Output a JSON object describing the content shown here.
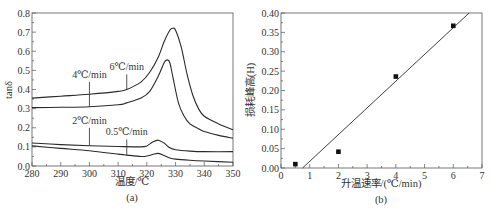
{
  "figure": {
    "caption_a": "(a)",
    "caption_b": "(b)"
  },
  "chart_data": [
    {
      "id": "a",
      "type": "line",
      "title": "",
      "xlabel": "温度/℃",
      "ylabel": "tanδ",
      "xlim": [
        280,
        350
      ],
      "ylim": [
        0.0,
        0.8
      ],
      "xticks": [
        280,
        290,
        300,
        310,
        320,
        330,
        340,
        350
      ],
      "xtick_labels": [
        "280",
        "290",
        "300",
        "310",
        "320",
        "330",
        "340",
        "350"
      ],
      "yticks": [
        0.0,
        0.1,
        0.2,
        0.3,
        0.4,
        0.5,
        0.6,
        0.7,
        0.8
      ],
      "ytick_labels": [
        "0.0",
        "0.1",
        "0.2",
        "0.3",
        "0.4",
        "0.5",
        "0.6",
        "0.7",
        "0.8"
      ],
      "grid": false,
      "legend": "inline annotations",
      "series": [
        {
          "name": "6℃/min",
          "x": [
            280,
            290,
            300,
            310,
            313,
            318,
            321,
            324,
            326,
            328,
            329,
            330,
            332,
            334,
            336,
            338,
            340,
            345,
            350
          ],
          "y": [
            0.355,
            0.365,
            0.375,
            0.39,
            0.4,
            0.44,
            0.49,
            0.57,
            0.65,
            0.71,
            0.72,
            0.71,
            0.62,
            0.48,
            0.37,
            0.3,
            0.26,
            0.22,
            0.19
          ],
          "label_x": 313,
          "label_y": 0.5,
          "anchor_x": 313,
          "anchor_y": 0.4
        },
        {
          "name": "4℃/min",
          "x": [
            280,
            290,
            300,
            310,
            313,
            318,
            321,
            324,
            326,
            327,
            328,
            329,
            331,
            333,
            335,
            338,
            340,
            345,
            350
          ],
          "y": [
            0.305,
            0.307,
            0.31,
            0.32,
            0.33,
            0.355,
            0.39,
            0.47,
            0.54,
            0.555,
            0.54,
            0.47,
            0.33,
            0.26,
            0.22,
            0.195,
            0.18,
            0.16,
            0.145
          ],
          "label_x": 300,
          "label_y": 0.46,
          "anchor_x": 300,
          "anchor_y": 0.31
        },
        {
          "name": "2℃/min",
          "x": [
            280,
            290,
            300,
            310,
            318,
            320,
            322,
            324,
            326,
            328,
            330,
            335,
            340,
            350
          ],
          "y": [
            0.12,
            0.112,
            0.106,
            0.102,
            0.1,
            0.105,
            0.125,
            0.135,
            0.12,
            0.095,
            0.085,
            0.078,
            0.075,
            0.075
          ],
          "label_x": 300,
          "label_y": 0.22,
          "anchor_x": 300,
          "anchor_y": 0.106
        },
        {
          "name": "0.5℃/min",
          "x": [
            280,
            290,
            300,
            310,
            313,
            318,
            320,
            322,
            324,
            326,
            328,
            330,
            335,
            340,
            350
          ],
          "y": [
            0.105,
            0.092,
            0.08,
            0.062,
            0.057,
            0.05,
            0.052,
            0.06,
            0.066,
            0.055,
            0.042,
            0.036,
            0.03,
            0.026,
            0.02
          ],
          "label_x": 313,
          "label_y": 0.16,
          "anchor_x": 313,
          "anchor_y": 0.057
        }
      ]
    },
    {
      "id": "b",
      "type": "scatter",
      "title": "",
      "xlabel": "升温速率/(℃/min)",
      "ylabel": "损耗峰高(H)",
      "xlim": [
        0,
        7
      ],
      "ylim": [
        0.0,
        0.4
      ],
      "xticks": [
        0,
        1,
        2,
        3,
        4,
        5,
        6,
        7
      ],
      "xtick_labels": [
        "0",
        "1",
        "2",
        "3",
        "4",
        "5",
        "6",
        "7"
      ],
      "yticks": [
        0.0,
        0.05,
        0.1,
        0.15,
        0.2,
        0.25,
        0.3,
        0.35,
        0.4
      ],
      "ytick_labels": [
        "0.00",
        "0.05",
        "0.10",
        "0.15",
        "0.20",
        "0.25",
        "0.30",
        "0.35",
        "0.40"
      ],
      "grid": false,
      "legend": "none",
      "series": [
        {
          "name": "data",
          "x": [
            0.5,
            2.0,
            4.0,
            6.0
          ],
          "y": [
            0.01,
            0.042,
            0.236,
            0.367
          ]
        }
      ],
      "fit_line": {
        "x": [
          0.75,
          6.55
        ],
        "y": [
          0.0,
          0.4
        ]
      }
    }
  ]
}
